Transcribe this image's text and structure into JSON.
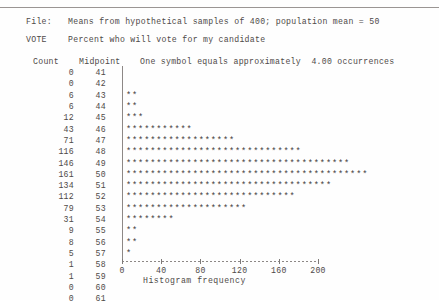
{
  "header": {
    "file_label": "File:",
    "file_value": "Means from hypothetical samples of 400; population mean = 50",
    "vote_label": "VOTE",
    "vote_value": "Percent who will vote for my candidate",
    "col_count": "Count",
    "col_midpoint": "Midpoint",
    "symbol_note": "One symbol equals approximately  4.00 occurrences"
  },
  "axis": {
    "title": "Histogram frequency",
    "ticks": [
      "0",
      "40",
      "80",
      "120",
      "160",
      "200"
    ],
    "min": 0,
    "max": 200
  },
  "symbol": "*",
  "chart_data": {
    "type": "bar",
    "title": "Means from hypothetical samples of 400; population mean = 50",
    "subtitle": "Percent who will vote for my candidate",
    "xlabel": "Histogram frequency",
    "ylabel": "Midpoint",
    "xlim": [
      0,
      200
    ],
    "xticks": [
      0,
      40,
      80,
      120,
      160,
      200
    ],
    "grid": false,
    "orientation": "horizontal",
    "symbol_scale": 4.0,
    "symbol_note": "One symbol equals approximately  4.00 occurrences",
    "categories": [
      41,
      42,
      43,
      44,
      45,
      46,
      47,
      48,
      49,
      50,
      51,
      52,
      53,
      54,
      55,
      56,
      57,
      58,
      59,
      60,
      61
    ],
    "values": [
      0,
      0,
      6,
      6,
      12,
      43,
      71,
      116,
      146,
      161,
      134,
      112,
      79,
      31,
      9,
      8,
      5,
      1,
      1,
      0,
      0
    ],
    "symbols": [
      0,
      0,
      2,
      2,
      3,
      11,
      18,
      29,
      37,
      40,
      34,
      28,
      20,
      8,
      2,
      2,
      1,
      0,
      0,
      0,
      0
    ]
  },
  "colors": {
    "text": "#4e4a48",
    "rule": "#9a9593",
    "axis": "#8d8886",
    "background": "#fefefe"
  }
}
